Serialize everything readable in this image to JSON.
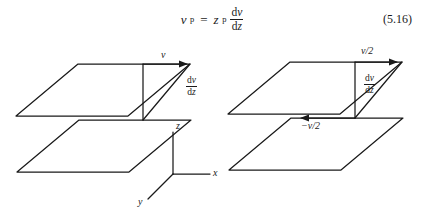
{
  "equation": {
    "lhs_var": "v",
    "lhs_sub": "p",
    "equals": "=",
    "rhs_var": "z",
    "rhs_sub": "p",
    "frac_d_num": "d",
    "frac_num_var": "v",
    "frac_d_den": "d",
    "frac_den_var": "z",
    "number": "(5.16)"
  },
  "figure": {
    "left_diagram": {
      "name": "two-parallel-planes-single-velocity",
      "velocity_label": "v",
      "gradient_num_d": "d",
      "gradient_num_var": "v",
      "gradient_den_d": "d",
      "gradient_den_var": "z",
      "axes": {
        "z_label": "z",
        "x_label": "x",
        "y_label": "y"
      }
    },
    "right_diagram": {
      "name": "two-parallel-planes-split-velocity",
      "top_velocity_label": "v/2",
      "bottom_velocity_label": "−v/2",
      "gradient_num_d": "d",
      "gradient_num_var": "v",
      "gradient_den_d": "d",
      "gradient_den_var": "z"
    }
  },
  "style": {
    "ink": "#1a1a1a",
    "background": "#ffffff"
  }
}
